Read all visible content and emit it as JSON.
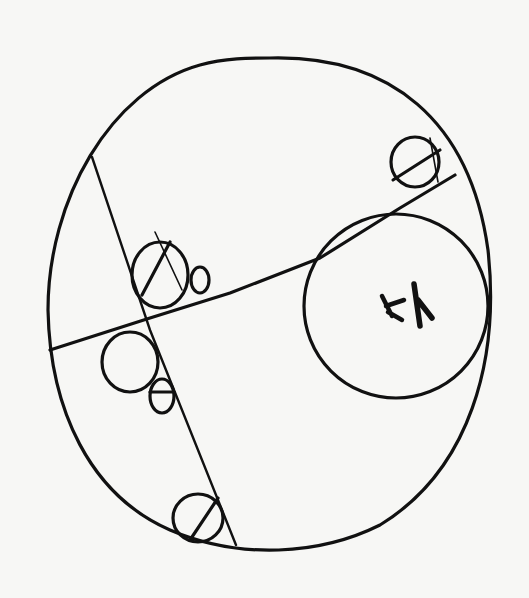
{
  "figure": {
    "kind": "hand-drawn sketch",
    "ink_color": "#111111",
    "paper_color": "#f7f7f5"
  },
  "label": {
    "text": "‹‹/",
    "note": "illegible hand-scribbled mark inside large right circle"
  },
  "elements": [
    {
      "id": "outer-ellipse",
      "type": "ellipse"
    },
    {
      "id": "inner-circle",
      "type": "circle"
    },
    {
      "id": "chord-long",
      "type": "line"
    },
    {
      "id": "chord-diagonal",
      "type": "line"
    },
    {
      "id": "small-circle-top-right",
      "type": "hatched-circle"
    },
    {
      "id": "small-circle-center",
      "type": "hatched-circle"
    },
    {
      "id": "small-circle-bottom",
      "type": "hatched-circle"
    },
    {
      "id": "small-circle-left",
      "type": "circle"
    },
    {
      "id": "tiny-oval-1",
      "type": "oval"
    },
    {
      "id": "tiny-oval-2",
      "type": "oval"
    }
  ]
}
